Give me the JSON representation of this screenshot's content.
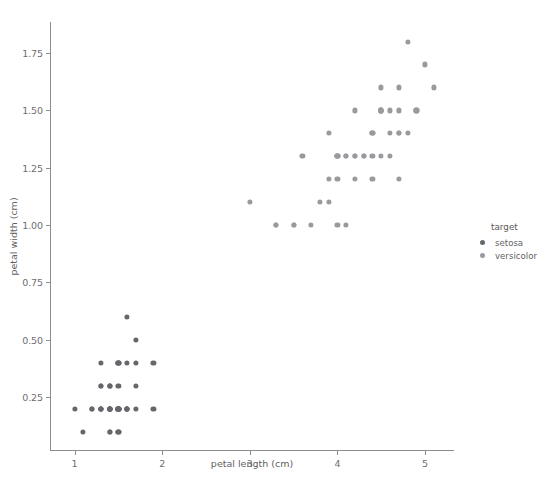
{
  "chart_data": {
    "type": "scatter",
    "title": "",
    "xlabel": "petal length (cm)",
    "ylabel": "petal width (cm)",
    "xlim": [
      0.72,
      5.33
    ],
    "ylim": [
      0.015,
      1.885
    ],
    "xticks": [
      "1",
      "2",
      "3",
      "4",
      "5"
    ],
    "xtick_values": [
      1,
      2,
      3,
      4,
      5
    ],
    "yticks": [
      "0.25",
      "0.50",
      "0.75",
      "1.00",
      "1.25",
      "1.50",
      "1.75"
    ],
    "ytick_values": [
      0.25,
      0.5,
      0.75,
      1.0,
      1.25,
      1.5,
      1.75
    ],
    "grid": false,
    "legend": {
      "title": "target",
      "position": "right-outside",
      "entries": [
        {
          "label": "setosa",
          "color": "#67676b"
        },
        {
          "label": "versicolor",
          "color": "#9a9a9e"
        }
      ]
    },
    "series": [
      {
        "name": "setosa",
        "color": "#67676b",
        "points": [
          [
            1.4,
            0.2
          ],
          [
            1.4,
            0.2
          ],
          [
            1.3,
            0.2
          ],
          [
            1.5,
            0.2
          ],
          [
            1.4,
            0.2
          ],
          [
            1.7,
            0.4
          ],
          [
            1.4,
            0.3
          ],
          [
            1.5,
            0.2
          ],
          [
            1.4,
            0.2
          ],
          [
            1.5,
            0.1
          ],
          [
            1.5,
            0.2
          ],
          [
            1.6,
            0.2
          ],
          [
            1.4,
            0.1
          ],
          [
            1.1,
            0.1
          ],
          [
            1.2,
            0.2
          ],
          [
            1.5,
            0.4
          ],
          [
            1.3,
            0.4
          ],
          [
            1.4,
            0.3
          ],
          [
            1.7,
            0.3
          ],
          [
            1.5,
            0.3
          ],
          [
            1.7,
            0.2
          ],
          [
            1.5,
            0.4
          ],
          [
            1.0,
            0.2
          ],
          [
            1.7,
            0.5
          ],
          [
            1.9,
            0.2
          ],
          [
            1.6,
            0.2
          ],
          [
            1.6,
            0.4
          ],
          [
            1.5,
            0.2
          ],
          [
            1.4,
            0.2
          ],
          [
            1.6,
            0.2
          ],
          [
            1.6,
            0.2
          ],
          [
            1.5,
            0.4
          ],
          [
            1.5,
            0.1
          ],
          [
            1.4,
            0.2
          ],
          [
            1.5,
            0.2
          ],
          [
            1.2,
            0.2
          ],
          [
            1.3,
            0.2
          ],
          [
            1.4,
            0.1
          ],
          [
            1.3,
            0.2
          ],
          [
            1.5,
            0.2
          ],
          [
            1.3,
            0.3
          ],
          [
            1.3,
            0.3
          ],
          [
            1.3,
            0.2
          ],
          [
            1.6,
            0.6
          ],
          [
            1.9,
            0.4
          ],
          [
            1.4,
            0.3
          ],
          [
            1.6,
            0.2
          ],
          [
            1.4,
            0.2
          ],
          [
            1.5,
            0.2
          ],
          [
            1.4,
            0.2
          ]
        ]
      },
      {
        "name": "versicolor",
        "color": "#9a9a9e",
        "points": [
          [
            4.7,
            1.4
          ],
          [
            4.5,
            1.5
          ],
          [
            4.9,
            1.5
          ],
          [
            4.0,
            1.3
          ],
          [
            4.6,
            1.5
          ],
          [
            4.5,
            1.3
          ],
          [
            4.7,
            1.6
          ],
          [
            3.3,
            1.0
          ],
          [
            4.6,
            1.3
          ],
          [
            3.9,
            1.4
          ],
          [
            3.5,
            1.0
          ],
          [
            4.2,
            1.5
          ],
          [
            4.0,
            1.0
          ],
          [
            4.7,
            1.4
          ],
          [
            3.6,
            1.3
          ],
          [
            4.4,
            1.4
          ],
          [
            4.5,
            1.5
          ],
          [
            4.1,
            1.0
          ],
          [
            4.5,
            1.5
          ],
          [
            3.9,
            1.1
          ],
          [
            4.8,
            1.8
          ],
          [
            4.0,
            1.3
          ],
          [
            4.9,
            1.5
          ],
          [
            4.7,
            1.2
          ],
          [
            4.3,
            1.3
          ],
          [
            4.4,
            1.4
          ],
          [
            4.8,
            1.4
          ],
          [
            5.0,
            1.7
          ],
          [
            4.5,
            1.5
          ],
          [
            3.5,
            1.0
          ],
          [
            3.8,
            1.1
          ],
          [
            3.7,
            1.0
          ],
          [
            3.9,
            1.2
          ],
          [
            5.1,
            1.6
          ],
          [
            4.5,
            1.5
          ],
          [
            4.5,
            1.6
          ],
          [
            4.7,
            1.5
          ],
          [
            4.4,
            1.3
          ],
          [
            4.1,
            1.3
          ],
          [
            4.0,
            1.3
          ],
          [
            4.4,
            1.2
          ],
          [
            4.6,
            1.4
          ],
          [
            4.0,
            1.2
          ],
          [
            3.3,
            1.0
          ],
          [
            4.2,
            1.3
          ],
          [
            4.2,
            1.2
          ],
          [
            4.2,
            1.3
          ],
          [
            4.3,
            1.3
          ],
          [
            3.0,
            1.1
          ],
          [
            4.1,
            1.3
          ]
        ]
      }
    ]
  }
}
